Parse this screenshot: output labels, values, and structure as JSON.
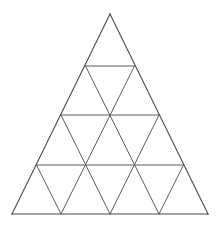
{
  "figure": {
    "name": "subdivided-equilateral-triangle",
    "background_color": "#ffffff",
    "line_color": "#5a5a5a",
    "outline_color": "#4a4a4a",
    "line_width": 1,
    "rows": 4,
    "small_triangle_count": 16,
    "upward_triangle_count": 10,
    "downward_triangle_count": 6,
    "canvas": {
      "width": 222,
      "height": 229
    },
    "vertices": {
      "apex": {
        "x": 110,
        "y": 14
      },
      "bottom_left": {
        "x": 12,
        "y": 214
      },
      "bottom_right": {
        "x": 208,
        "y": 214
      }
    },
    "row_y_positions": [
      14,
      66,
      115,
      165,
      214
    ],
    "rows_detail": [
      {
        "row": 0,
        "y": 14,
        "node_count": 1,
        "x_positions": [
          110
        ]
      },
      {
        "row": 1,
        "y": 66,
        "node_count": 2,
        "x_positions": [
          85.5,
          134.5
        ]
      },
      {
        "row": 2,
        "y": 115,
        "node_count": 3,
        "x_positions": [
          61,
          110,
          159
        ]
      },
      {
        "row": 3,
        "y": 165,
        "node_count": 4,
        "x_positions": [
          36.5,
          85.5,
          134.5,
          183.5
        ]
      },
      {
        "row": 4,
        "y": 214,
        "node_count": 5,
        "x_positions": [
          12,
          61,
          110,
          159,
          208
        ]
      }
    ],
    "horizontal_lines": [
      {
        "index": 0,
        "y": 66,
        "x1": 85.5,
        "x2": 134.5
      },
      {
        "index": 1,
        "y": 115,
        "x1": 61,
        "x2": 159
      },
      {
        "index": 2,
        "y": 165,
        "x1": 36.5,
        "x2": 183.5
      },
      {
        "index": 3,
        "y": 214,
        "x1": 12,
        "x2": 208
      }
    ],
    "left_diagonals": [
      {
        "index": 0,
        "x1": 110,
        "y1": 14,
        "x2": 208,
        "y2": 214
      },
      {
        "index": 1,
        "x1": 85.5,
        "y1": 66,
        "x2": 159,
        "y2": 214
      },
      {
        "index": 2,
        "x1": 61,
        "y1": 115,
        "x2": 110,
        "y2": 214
      },
      {
        "index": 3,
        "x1": 36.5,
        "y1": 165,
        "x2": 61,
        "y2": 214
      }
    ],
    "right_diagonals": [
      {
        "index": 0,
        "x1": 110,
        "y1": 14,
        "x2": 12,
        "y2": 214
      },
      {
        "index": 1,
        "x1": 134.5,
        "y1": 66,
        "x2": 61,
        "y2": 214
      },
      {
        "index": 2,
        "x1": 159,
        "y1": 115,
        "x2": 110,
        "y2": 214
      },
      {
        "index": 3,
        "x1": 183.5,
        "y1": 165,
        "x2": 159,
        "y2": 214
      }
    ]
  }
}
